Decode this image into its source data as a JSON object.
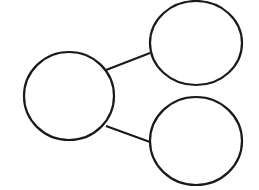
{
  "diagram": {
    "type": "number-bond",
    "stroke_color": "#1a1a1a",
    "background": "#ffffff",
    "nodes": [
      {
        "id": "whole",
        "label": "",
        "cx": 69,
        "cy": 96,
        "rx": 45,
        "ry": 44
      },
      {
        "id": "part-top",
        "label": "",
        "cx": 196,
        "cy": 43,
        "rx": 46,
        "ry": 42
      },
      {
        "id": "part-bottom",
        "label": "",
        "cx": 196,
        "cy": 141,
        "rx": 46,
        "ry": 44
      }
    ],
    "edges": [
      {
        "from": "whole",
        "to": "part-top",
        "x1": 106,
        "y1": 70,
        "x2": 150,
        "y2": 53
      },
      {
        "from": "whole",
        "to": "part-bottom",
        "x1": 106,
        "y1": 126,
        "x2": 150,
        "y2": 142
      }
    ]
  }
}
